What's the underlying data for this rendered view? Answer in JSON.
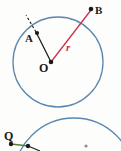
{
  "figure": {
    "type": "geometry-diagram",
    "background_color": "#fdfdfc",
    "circle_color": "#5b88ad",
    "radius_line_color": "#c83250",
    "chord_line_color": "#1a1a1a",
    "tangent_line_color": "#4f7f2f",
    "point_color": "#1a1a1a"
  },
  "top_figure": {
    "circle": {
      "cx": 58,
      "cy": 62,
      "r": 45
    },
    "center_point": {
      "label": "O",
      "x": 51,
      "y": 62
    },
    "points": [
      {
        "label": "A",
        "x": 37,
        "y": 34
      },
      {
        "label": "B",
        "x": 91,
        "y": 9
      }
    ],
    "radius_label": "r",
    "segments": [
      {
        "name": "radius-to-B",
        "from": "O",
        "to": "B",
        "color": "#c83250"
      },
      {
        "name": "segment-to-A",
        "from": "O",
        "to": "A",
        "color": "#1a1a1a"
      },
      {
        "name": "dashed-extension-A",
        "from": "A",
        "to": "circle-edge",
        "color": "#1a1a1a",
        "style": "dashed"
      }
    ]
  },
  "bottom_figure": {
    "circle": {
      "cx": 74,
      "cy": 178,
      "r": 60
    },
    "points": [
      {
        "label": "Q",
        "x": 11,
        "y": 144
      },
      {
        "label": "",
        "x": 28,
        "y": 146
      }
    ],
    "segments": [
      {
        "name": "tangent-from-Q",
        "from": "Q",
        "to": "tangent-point",
        "color": "#4f7f2f"
      },
      {
        "name": "tangent-extension",
        "from": "tangent-point",
        "to": "lower-right",
        "color": "#1a1a1a"
      }
    ]
  }
}
